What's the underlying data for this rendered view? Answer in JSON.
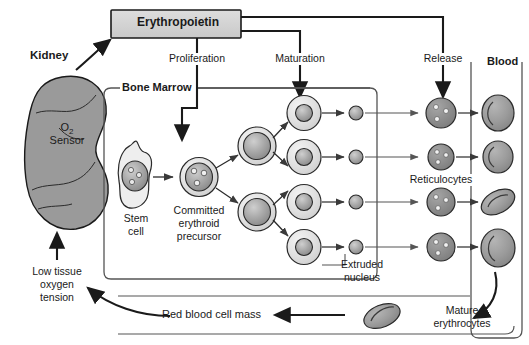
{
  "diagram": {
    "type": "biological-flow-diagram"
  },
  "palette": {
    "background": "#ffffff",
    "stroke": "#1a1a1a",
    "box_fill": "#d4d4d4",
    "kidney_fill": "#9a9a9a",
    "cell_light": "#e2e2e2",
    "cell_mid": "#c0c0c0",
    "nucleus": "#9e9e9e",
    "reticulocyte": "#8e8e8e",
    "erythrocyte": "#9c9c9c",
    "thin_line": "#555555"
  },
  "boxes": {
    "erythropoietin": {
      "label": "Erythropoietin"
    },
    "bone_marrow": {
      "label": "Bone Marrow"
    },
    "blood": {
      "label": "Blood"
    }
  },
  "labels": {
    "kidney": "Kidney",
    "o2_sensor_line1": "O",
    "o2_sensor_sub": "2",
    "o2_sensor_line2": "Sensor",
    "low_tissue_1": "Low tissue",
    "low_tissue_2": "oxygen",
    "low_tissue_3": "tension",
    "proliferation": "Proliferation",
    "maturation": "Maturation",
    "release": "Release",
    "stem_cell_1": "Stem",
    "stem_cell_2": "cell",
    "committed_1": "Committed",
    "committed_2": "erythroid",
    "committed_3": "precursor",
    "extruded_1": "Extruded",
    "extruded_2": "nucleus",
    "reticulocytes": "Reticulocytes",
    "mature_1": "Mature",
    "mature_2": "erythrocytes",
    "rbc_mass": "Red blood cell mass"
  },
  "cells": {
    "stem_cell": {
      "name": "stem-cell",
      "nuclei_spots": 3
    },
    "committed_precursor": {
      "name": "committed-erythroid-precursor",
      "nuclei_spots": 3
    },
    "erythroblasts_stage1": 2,
    "erythroblasts_stage2": 4,
    "extruded_nuclei": 4,
    "reticulocytes": 4,
    "blood_erythrocytes": 4,
    "mature_erythrocyte_vessel": 1
  },
  "flow": {
    "steps": [
      "Low tissue oxygen tension",
      "Kidney O2 Sensor",
      "Erythropoietin",
      "Proliferation",
      "Maturation",
      "Release",
      "Blood",
      "Red blood cell mass"
    ]
  }
}
